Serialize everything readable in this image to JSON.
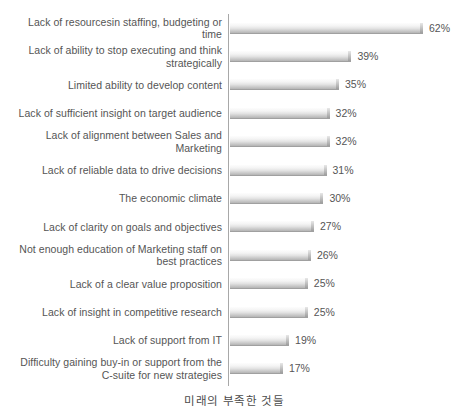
{
  "chart_data": {
    "type": "bar",
    "orientation": "horizontal",
    "title": "",
    "subtitle": "",
    "xlabel": "미래의 부족한 것들",
    "ylabel": "",
    "grid": false,
    "legend": null,
    "xlim": [
      0,
      62
    ],
    "value_suffix": "%",
    "categories": [
      "Lack of resourcesin staffing, budgeting or time",
      "Lack of ability to stop executing and think strategically",
      "Limited ability to develop content",
      "Lack of sufficient insight on target audience",
      "Lack of alignment between Sales and Marketing",
      "Lack of reliable data to drive decisions",
      "The economic climate",
      "Lack of clarity on goals and objectives",
      "Not enough education of Marketing staff on best practices",
      "Lack of a clear value proposition",
      "Lack of insight in competitive research",
      "Lack of support from IT",
      "Difficulty gaining buy-in or support from the C-suite for new strategies"
    ],
    "values": [
      62,
      39,
      35,
      32,
      32,
      31,
      30,
      27,
      26,
      25,
      25,
      19,
      17
    ],
    "value_labels": [
      "62%",
      "39%",
      "35%",
      "32%",
      "32%",
      "31%",
      "30%",
      "27%",
      "26%",
      "25%",
      "25%",
      "19%",
      "17%"
    ],
    "colors": {
      "bar_light": "#fdfdfd",
      "bar_mid": "#e3e3e3",
      "bar_dark": "#b4b4b4",
      "axis": "#a8a8a8",
      "text": "#555555",
      "background": "#ffffff"
    }
  }
}
